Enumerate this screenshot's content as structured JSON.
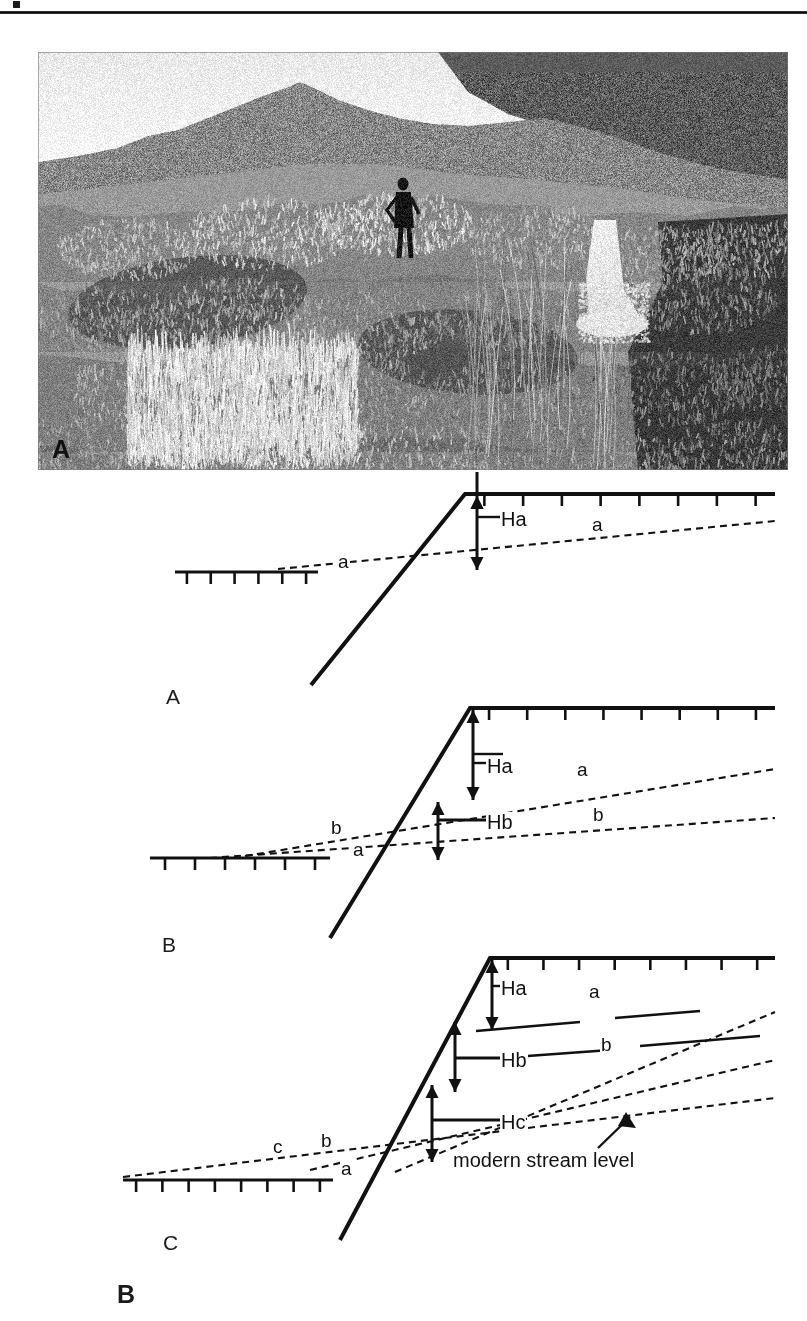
{
  "figure": {
    "panels": [
      {
        "id": "photo",
        "label": "A"
      },
      {
        "id": "diagrams",
        "label": "B"
      }
    ]
  },
  "photo": {
    "label": "A",
    "description": "Grayscale field photograph of a sagebrush-covered stream terrace riser with a person standing mid-slope for scale, a small waterfall at right, and mountain ridges on the skyline."
  },
  "diagrams": {
    "figure_label": "B",
    "panels": [
      {
        "letter": "A",
        "heights": [
          "Ha"
        ],
        "surface_labels_right": [
          "a"
        ],
        "surface_labels_left": [
          "a"
        ]
      },
      {
        "letter": "B",
        "heights": [
          "Ha",
          "Hb"
        ],
        "surface_labels_right": [
          "a",
          "b"
        ],
        "surface_labels_left": [
          "b",
          "a"
        ]
      },
      {
        "letter": "C",
        "heights": [
          "Ha",
          "Hb",
          "Hc"
        ],
        "surface_labels_right": [
          "a",
          "b"
        ],
        "surface_labels_left": [
          "c",
          "b",
          "a"
        ],
        "annotation": "modern stream level"
      }
    ],
    "labels": {
      "ha": "Ha",
      "hb": "Hb",
      "hc": "Hc",
      "a": "a",
      "b": "b",
      "c": "c",
      "modern_stream_level": "modern stream level"
    }
  },
  "colors": {
    "ink": "#111111",
    "rule": "#1c1c1c",
    "paper": "#ffffff"
  }
}
